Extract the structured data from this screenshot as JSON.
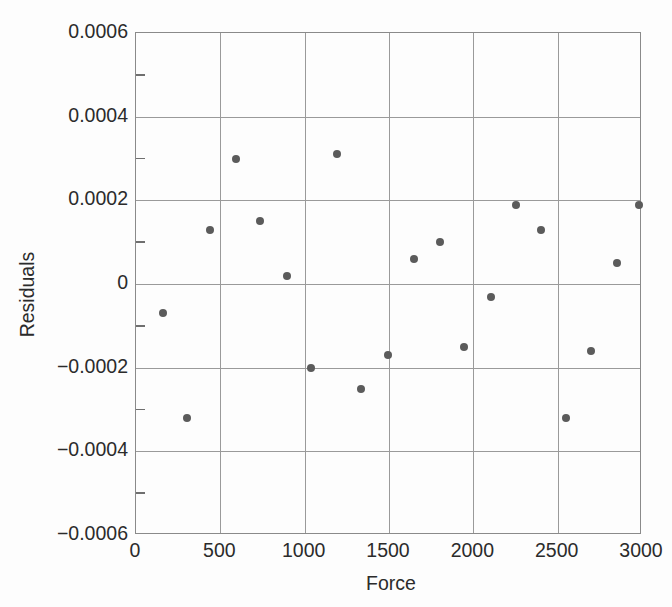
{
  "chart_data": {
    "type": "scatter",
    "title": "",
    "xlabel": "Force",
    "ylabel": "Residuals",
    "xlim": [
      0,
      3000
    ],
    "ylim": [
      -0.0006,
      0.0006
    ],
    "grid": true,
    "legend": null,
    "x_ticks": [
      0,
      500,
      1000,
      1500,
      2000,
      2500,
      3000
    ],
    "x_tick_labels": [
      "0",
      "500",
      "1000",
      "1500",
      "2000",
      "2500",
      "3000"
    ],
    "y_ticks": [
      -0.0006,
      -0.0004,
      -0.0002,
      0,
      0.0002,
      0.0004,
      0.0006
    ],
    "y_tick_labels": [
      "−0.0006",
      "−0.0004",
      "−0.0002",
      "0",
      "0.0002",
      "0.0004",
      "0.0006"
    ],
    "y_minor_ticks": [
      -0.0005,
      -0.0003,
      -0.0001,
      0.0001,
      0.0003,
      0.0005
    ],
    "marker": "circle",
    "marker_color": "#5b5b5b",
    "marker_size": 8,
    "points": [
      {
        "x": 160,
        "y": -7e-05
      },
      {
        "x": 300,
        "y": -0.00032
      },
      {
        "x": 440,
        "y": 0.00013
      },
      {
        "x": 590,
        "y": 0.0003
      },
      {
        "x": 735,
        "y": 0.00015
      },
      {
        "x": 895,
        "y": 2e-05
      },
      {
        "x": 1040,
        "y": -0.0002
      },
      {
        "x": 1190,
        "y": 0.00031
      },
      {
        "x": 1335,
        "y": -0.00025
      },
      {
        "x": 1495,
        "y": -0.00017
      },
      {
        "x": 1650,
        "y": 6e-05
      },
      {
        "x": 1800,
        "y": 0.0001
      },
      {
        "x": 1945,
        "y": -0.00015
      },
      {
        "x": 2105,
        "y": -3e-05
      },
      {
        "x": 2255,
        "y": 0.00019
      },
      {
        "x": 2400,
        "y": 0.00013
      },
      {
        "x": 2550,
        "y": -0.00032
      },
      {
        "x": 2700,
        "y": -0.00016
      },
      {
        "x": 2850,
        "y": 5e-05
      },
      {
        "x": 2985,
        "y": 0.00019
      }
    ]
  },
  "colors": {
    "marker": "#5b5b5b",
    "grid": "#9a9a9a",
    "axis": "#8a8a8a",
    "text": "#2b2b2b",
    "background": "#fdfdfd"
  }
}
